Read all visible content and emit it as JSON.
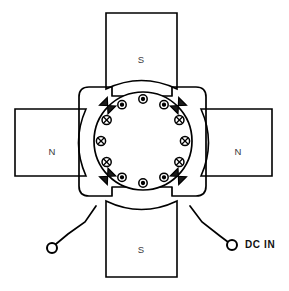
{
  "diagram": {
    "type": "electrical-machine-cross-section",
    "canvas": {
      "width": 289,
      "height": 291
    },
    "background_color": "#ffffff",
    "line_color": "#000000",
    "label_color": "#3a3a3a"
  },
  "poles": [
    {
      "id": "pole-top",
      "label": "S",
      "position": "top",
      "box": {
        "x": 105,
        "y": 12,
        "w": 72,
        "h": 76
      },
      "label_x": 141,
      "label_y": 60
    },
    {
      "id": "pole-right",
      "label": "N",
      "position": "right",
      "box": {
        "x": 200,
        "y": 108,
        "w": 72,
        "h": 68
      },
      "label_x": 238,
      "label_y": 152
    },
    {
      "id": "pole-bottom",
      "label": "S",
      "position": "bottom",
      "box": {
        "x": 105,
        "y": 202,
        "w": 72,
        "h": 76
      },
      "label_x": 141,
      "label_y": 250
    },
    {
      "id": "pole-left",
      "label": "N",
      "position": "left",
      "box": {
        "x": 14,
        "y": 108,
        "w": 72,
        "h": 68
      },
      "label_x": 52,
      "label_y": 152
    }
  ],
  "armature": {
    "center_x": 143,
    "center_y": 141,
    "outer_radius": 49,
    "conductor_ring_radius": 42,
    "conductor_count": 12,
    "conductors": [
      {
        "index": 0,
        "angle_deg": 270,
        "symbol": "dot",
        "meaning": "current out of page"
      },
      {
        "index": 1,
        "angle_deg": 300,
        "symbol": "dot",
        "meaning": "current out of page"
      },
      {
        "index": 2,
        "angle_deg": 330,
        "symbol": "cross",
        "meaning": "current into page"
      },
      {
        "index": 3,
        "angle_deg": 0,
        "symbol": "cross",
        "meaning": "current into page"
      },
      {
        "index": 4,
        "angle_deg": 30,
        "symbol": "cross",
        "meaning": "current into page"
      },
      {
        "index": 5,
        "angle_deg": 60,
        "symbol": "dot",
        "meaning": "current out of page"
      },
      {
        "index": 6,
        "angle_deg": 90,
        "symbol": "dot",
        "meaning": "current out of page"
      },
      {
        "index": 7,
        "angle_deg": 120,
        "symbol": "dot",
        "meaning": "current out of page"
      },
      {
        "index": 8,
        "angle_deg": 150,
        "symbol": "cross",
        "meaning": "current into page"
      },
      {
        "index": 9,
        "angle_deg": 180,
        "symbol": "cross",
        "meaning": "current into page"
      },
      {
        "index": 10,
        "angle_deg": 210,
        "symbol": "cross",
        "meaning": "current into page"
      },
      {
        "index": 11,
        "angle_deg": 240,
        "symbol": "dot",
        "meaning": "current out of page"
      }
    ]
  },
  "brushes": [
    {
      "id": "brush-top-left",
      "angle_deg": 225,
      "shape": "bowtie"
    },
    {
      "id": "brush-top-right",
      "angle_deg": 315,
      "shape": "bowtie"
    },
    {
      "id": "brush-bottom-right",
      "angle_deg": 45,
      "shape": "bowtie"
    },
    {
      "id": "brush-bottom-left",
      "angle_deg": 135,
      "shape": "bowtie"
    }
  ],
  "terminals": [
    {
      "id": "terminal-left",
      "label": "",
      "cx": 52,
      "cy": 248,
      "r": 5
    },
    {
      "id": "terminal-right",
      "label": "DC IN",
      "cx": 232,
      "cy": 245,
      "r": 5,
      "label_x": 245,
      "label_y": 245
    }
  ],
  "leads": {
    "left_path": "M 96 206 L 85 222 L 68 234 L 56 244",
    "right_path": "M 190 206 L 202 222 L 220 236 L 228 242"
  },
  "labels": {
    "dc_in": "DC IN",
    "north": "N",
    "south": "S"
  }
}
